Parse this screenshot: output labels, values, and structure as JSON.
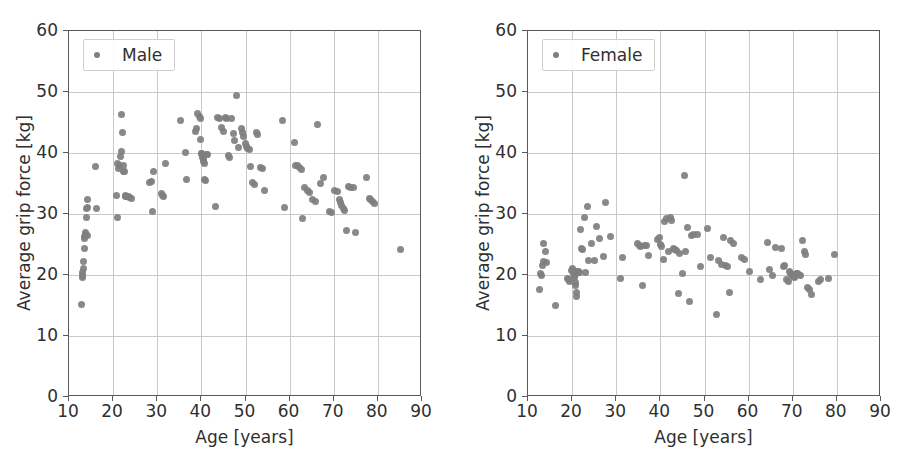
{
  "figure": {
    "width": 918,
    "height": 464,
    "background": "#ffffff",
    "marker_color": "#7f7f7f",
    "axis_color": "#5a5a5a",
    "grid_color": "#c9c9c9"
  },
  "chart_data": [
    {
      "type": "scatter",
      "title": "",
      "xlabel": "Age [years]",
      "ylabel": "Average grip force [kg]",
      "legend": [
        "Male"
      ],
      "legend_position": "upper left",
      "grid": true,
      "xlim": [
        10,
        90
      ],
      "ylim": [
        0,
        60
      ],
      "xticks": [
        10,
        20,
        30,
        40,
        50,
        60,
        70,
        80,
        90
      ],
      "yticks": [
        0,
        10,
        20,
        30,
        40,
        50,
        60
      ],
      "series": [
        {
          "name": "Male",
          "marker": "circle",
          "color": "#7f7f7f",
          "x": [
            12.9,
            13.0,
            13.1,
            13.1,
            13.2,
            13.3,
            13.4,
            13.5,
            13.6,
            13.7,
            13.8,
            13.9,
            14.0,
            14.1,
            14.2,
            14.3,
            15.9,
            16.3,
            20.7,
            20.9,
            21.0,
            21.2,
            21.4,
            21.6,
            21.8,
            22.0,
            22.1,
            22.3,
            22.4,
            22.5,
            22.7,
            22.9,
            23.1,
            23.4,
            23.8,
            24.1,
            28.3,
            28.6,
            28.9,
            29.2,
            30.9,
            31.2,
            31.5,
            31.8,
            35.3,
            36.3,
            36.6,
            38.6,
            38.9,
            39.2,
            39.5,
            39.7,
            39.9,
            40.0,
            40.1,
            40.2,
            40.3,
            40.4,
            40.5,
            40.6,
            40.8,
            41.0,
            41.2,
            41.5,
            43.3,
            43.6,
            44.2,
            44.6,
            45.0,
            45.4,
            45.8,
            46.1,
            46.4,
            46.8,
            47.2,
            47.6,
            48.0,
            48.4,
            49.0,
            49.3,
            49.6,
            49.9,
            50.2,
            50.5,
            50.8,
            51.1,
            51.6,
            52.0,
            52.4,
            52.8,
            53.3,
            53.8,
            54.2,
            58.4,
            58.8,
            61.0,
            61.4,
            61.8,
            62.2,
            62.6,
            63.0,
            63.4,
            64.0,
            64.6,
            65.2,
            65.8,
            66.4,
            67.0,
            67.6,
            69.0,
            69.6,
            70.2,
            70.8,
            71.2,
            71.5,
            71.8,
            72.1,
            72.4,
            72.8,
            73.3,
            73.8,
            74.4,
            75.0,
            77.4,
            78.0,
            78.4,
            78.8,
            79.2,
            85.2
          ],
          "y": [
            15.1,
            19.6,
            20.0,
            20.4,
            21.0,
            22.2,
            24.4,
            26.0,
            26.3,
            26.7,
            27.0,
            29.5,
            30.9,
            31.0,
            32.3,
            26.4,
            37.8,
            30.9,
            33.0,
            29.5,
            38.3,
            37.5,
            37.9,
            39.5,
            40.2,
            46.3,
            43.3,
            37.9,
            37.0,
            36.9,
            33.1,
            32.9,
            32.8,
            32.9,
            32.7,
            32.6,
            35.1,
            35.4,
            30.4,
            36.9,
            33.3,
            33.0,
            32.8,
            38.2,
            45.3,
            40.1,
            35.6,
            43.5,
            44.0,
            46.4,
            46.0,
            45.6,
            42.2,
            40.0,
            39.9,
            39.6,
            39.3,
            38.9,
            38.6,
            38.3,
            35.7,
            35.5,
            39.8,
            39.7,
            31.2,
            45.8,
            45.7,
            44.2,
            43.6,
            45.8,
            45.7,
            39.6,
            39.3,
            45.7,
            43.2,
            42.1,
            49.4,
            40.9,
            44.0,
            43.3,
            42.7,
            41.5,
            41.0,
            40.8,
            40.6,
            37.8,
            35.2,
            34.8,
            43.3,
            43.1,
            37.6,
            37.4,
            33.8,
            45.3,
            31.1,
            41.8,
            38.0,
            37.9,
            37.6,
            37.3,
            29.3,
            34.3,
            33.9,
            33.6,
            32.4,
            32.1,
            44.6,
            35.0,
            36.0,
            30.4,
            30.2,
            33.9,
            33.7,
            32.4,
            31.9,
            31.4,
            30.9,
            30.5,
            27.3,
            34.5,
            34.3,
            34.3,
            26.9,
            36.0,
            32.6,
            32.3,
            32.0,
            31.8,
            24.2
          ]
        }
      ]
    },
    {
      "type": "scatter",
      "title": "",
      "xlabel": "Age [years]",
      "ylabel": "Average grip force [kg]",
      "legend": [
        "Female"
      ],
      "legend_position": "upper left",
      "grid": true,
      "xlim": [
        10,
        90
      ],
      "ylim": [
        0,
        60
      ],
      "xticks": [
        10,
        20,
        30,
        40,
        50,
        60,
        70,
        80,
        90
      ],
      "yticks": [
        0,
        10,
        20,
        30,
        40,
        50,
        60
      ],
      "series": [
        {
          "name": "Female",
          "marker": "circle",
          "color": "#7f7f7f",
          "x": [
            12.6,
            12.8,
            13.0,
            13.2,
            13.4,
            13.6,
            13.9,
            14.2,
            16.2,
            19.0,
            19.2,
            19.5,
            19.8,
            20.0,
            20.2,
            20.4,
            20.5,
            20.6,
            20.7,
            20.8,
            20.9,
            21.0,
            21.1,
            21.3,
            21.5,
            21.7,
            21.9,
            22.1,
            22.4,
            22.7,
            23.0,
            23.4,
            23.8,
            24.4,
            25.0,
            25.6,
            26.2,
            27.0,
            27.6,
            28.6,
            31.0,
            31.4,
            34.8,
            35.2,
            35.6,
            36.0,
            36.4,
            36.8,
            37.2,
            39.4,
            39.8,
            40.0,
            40.3,
            40.6,
            41.0,
            41.4,
            41.8,
            42.2,
            42.6,
            42.9,
            43.2,
            43.6,
            44.0,
            44.4,
            45.0,
            45.4,
            45.8,
            46.2,
            46.6,
            47.0,
            47.6,
            48.4,
            49.2,
            50.6,
            51.4,
            52.8,
            53.2,
            53.8,
            54.4,
            54.8,
            55.2,
            55.6,
            56.0,
            56.6,
            58.4,
            59.0,
            60.2,
            62.8,
            64.2,
            64.8,
            65.4,
            66.0,
            67.4,
            67.8,
            68.2,
            68.6,
            69.0,
            69.3,
            69.5,
            69.7,
            69.9,
            70.1,
            70.3,
            70.5,
            70.8,
            71.1,
            71.4,
            71.8,
            72.2,
            72.6,
            73.0,
            73.4,
            73.8,
            74.2,
            75.8,
            76.4,
            78.0,
            79.4
          ],
          "y": [
            17.7,
            20.2,
            20.0,
            21.6,
            22.2,
            25.1,
            23.8,
            22.0,
            15.0,
            19.5,
            19.2,
            18.9,
            20.8,
            21.1,
            20.5,
            20.3,
            20.0,
            19.6,
            18.8,
            18.3,
            17.1,
            16.4,
            20.3,
            20.6,
            20.5,
            20.4,
            27.4,
            24.3,
            24.1,
            29.4,
            20.4,
            31.2,
            22.3,
            25.1,
            22.4,
            28.0,
            26.0,
            23.0,
            31.9,
            26.3,
            19.5,
            22.9,
            25.1,
            24.9,
            24.6,
            18.2,
            24.9,
            24.8,
            23.2,
            25.8,
            26.2,
            25.0,
            24.7,
            22.6,
            28.8,
            29.2,
            23.8,
            29.4,
            29.0,
            24.4,
            24.2,
            24.0,
            17.0,
            23.6,
            20.3,
            36.3,
            23.9,
            27.8,
            15.6,
            26.5,
            26.7,
            26.6,
            21.4,
            27.6,
            22.9,
            13.5,
            22.3,
            21.8,
            26.2,
            21.6,
            21.4,
            17.2,
            25.6,
            25.2,
            22.9,
            22.6,
            20.5,
            19.2,
            25.3,
            20.9,
            20.0,
            24.5,
            24.4,
            21.4,
            21.5,
            19.3,
            19.0,
            20.5,
            20.3,
            20.1,
            20.0,
            19.8,
            19.7,
            19.6,
            20.3,
            20.2,
            20.1,
            20.0,
            25.7,
            23.9,
            23.3,
            18.0,
            17.6,
            16.8,
            19.0,
            19.2,
            19.5,
            23.4
          ]
        }
      ]
    }
  ]
}
